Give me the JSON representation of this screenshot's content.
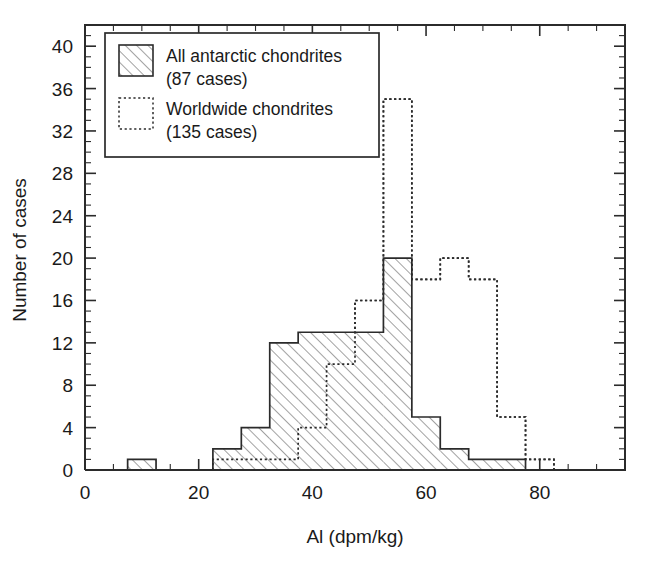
{
  "chart_data": {
    "type": "bar",
    "title": "",
    "xlabel": "Al (dpm/kg)",
    "ylabel": "Number of cases",
    "xlim": [
      0,
      95
    ],
    "ylim": [
      0,
      42
    ],
    "xticks": [
      0,
      20,
      40,
      60,
      80
    ],
    "xticklabels": [
      "0",
      "20",
      "40",
      "60",
      "80"
    ],
    "xminor_step": 5,
    "yticks": [
      0,
      4,
      8,
      12,
      16,
      20,
      24,
      28,
      32,
      36,
      40
    ],
    "yticklabels": [
      "0",
      "4",
      "8",
      "12",
      "16",
      "20",
      "24",
      "28",
      "32",
      "36",
      "40"
    ],
    "yminor_step": 1,
    "grid": false,
    "bin_width": 5,
    "bin_edges": [
      7.5,
      12.5,
      17.5,
      22.5,
      27.5,
      32.5,
      37.5,
      42.5,
      47.5,
      52.5,
      57.5,
      62.5,
      67.5,
      72.5,
      77.5,
      82.5
    ],
    "bin_centers": [
      10,
      15,
      20,
      25,
      30,
      35,
      40,
      45,
      50,
      55,
      60,
      65,
      70,
      75,
      80
    ],
    "series": [
      {
        "name": "All antarctic chondrites",
        "style": "hatched",
        "count_label": "(87 cases)",
        "total": 87,
        "values": [
          1,
          0,
          0,
          2,
          4,
          12,
          13,
          13,
          13,
          20,
          5,
          2,
          1,
          1,
          0
        ]
      },
      {
        "name": "Worldwide chondrites",
        "style": "dotted",
        "count_label": "(135 cases)",
        "total": 135,
        "values": [
          0,
          0,
          0,
          1,
          1,
          1,
          4,
          10,
          16,
          35,
          18,
          20,
          18,
          5,
          1
        ]
      }
    ],
    "legend": {
      "position": "upper-left",
      "entries": [
        {
          "label": "All antarctic chondrites",
          "sublabel": "(87 cases)",
          "swatch": "hatched"
        },
        {
          "label": "Worldwide chondrites",
          "sublabel": "(135 cases)",
          "swatch": "dotted"
        }
      ]
    },
    "colors": {
      "line": "#2b2b2b",
      "background": "#ffffff",
      "hatch": "#555555"
    }
  }
}
